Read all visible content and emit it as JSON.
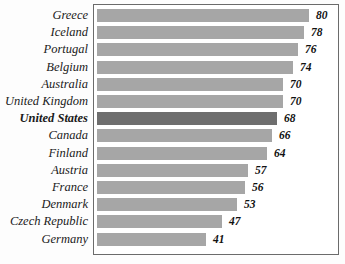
{
  "chart_data": {
    "type": "bar",
    "orientation": "horizontal",
    "title": "",
    "subtitle": "",
    "xlabel": "",
    "ylabel": "",
    "grid": false,
    "legend": null,
    "axis_visible": false,
    "xlim": [
      0,
      80
    ],
    "categories": [
      "Greece",
      "Iceland",
      "Portugal",
      "Belgium",
      "Australia",
      "United Kingdom",
      "United States",
      "Canada",
      "Finland",
      "Austria",
      "France",
      "Denmark",
      "Czech Republic",
      "Germany"
    ],
    "values": [
      80,
      78,
      76,
      74,
      70,
      70,
      68,
      66,
      64,
      57,
      56,
      53,
      47,
      41
    ],
    "value_labels": [
      "80",
      "78",
      "76",
      "74",
      "70",
      "70",
      "68",
      "66",
      "64",
      "57",
      "56",
      "53",
      "47",
      "41"
    ],
    "highlight_category": "United States",
    "highlight_index": 6,
    "colors": {
      "bar": "#a6a6a6",
      "bar_highlight": "#6e6e6e",
      "frame": "#6b6b6b",
      "background": "#fdfdfd",
      "plot_background": "#ffffff",
      "text": "#1a1a1a"
    }
  }
}
